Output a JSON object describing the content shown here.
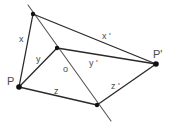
{
  "diagram": {
    "colors": {
      "lines": "#2a2a2a",
      "mirror_line": "#555555",
      "points": "#111111",
      "labels": "#4a4a4a"
    },
    "points": {
      "P": {
        "label": "P"
      },
      "P_prime": {
        "label": "P'"
      },
      "o": {
        "label": "o"
      }
    },
    "edges": {
      "x": {
        "label": "x"
      },
      "y": {
        "label": "y"
      },
      "z": {
        "label": "z"
      },
      "x_prime": {
        "label": "x '"
      },
      "y_prime": {
        "label": "y '"
      },
      "z_prime": {
        "label": "z '"
      }
    }
  }
}
